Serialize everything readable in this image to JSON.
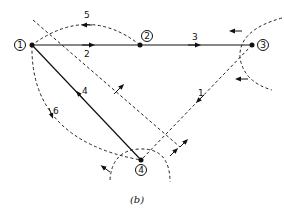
{
  "diagram": {
    "caption": "(b)",
    "nodes": [
      {
        "id": "1",
        "label": "1"
      },
      {
        "id": "2",
        "label": "2"
      },
      {
        "id": "3",
        "label": "3"
      },
      {
        "id": "4",
        "label": "4"
      }
    ],
    "edges": [
      {
        "id": "1",
        "label": "1",
        "from": "3",
        "to": "4",
        "style": "dashed",
        "type": "link"
      },
      {
        "id": "2",
        "label": "2",
        "from": "1",
        "to": "2",
        "style": "solid",
        "type": "tree-branch"
      },
      {
        "id": "3",
        "label": "3",
        "from": "2",
        "to": "3",
        "style": "solid",
        "type": "tree-branch"
      },
      {
        "id": "4",
        "label": "4",
        "from": "4",
        "to": "1",
        "style": "solid",
        "type": "tree-branch"
      },
      {
        "id": "5",
        "label": "5",
        "from": "2",
        "to": "1",
        "style": "dashed",
        "type": "link"
      },
      {
        "id": "6",
        "label": "6",
        "from": "1",
        "to": "4",
        "style": "dashed",
        "type": "link"
      }
    ],
    "cutsets": [
      {
        "name": "cutset-node-3",
        "style": "dashed-arc"
      },
      {
        "name": "cutset-node-4",
        "style": "dashed-arc"
      },
      {
        "name": "cutset-diagonal",
        "style": "dashed-line"
      }
    ]
  }
}
